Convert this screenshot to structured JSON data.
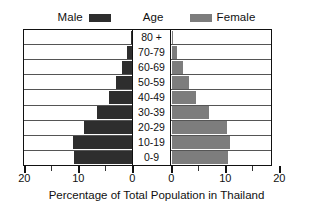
{
  "legend": {
    "male_label": "Male",
    "center_label": "Age",
    "female_label": "Female",
    "male_color": "#2e2e2e",
    "female_color": "#7d7d7d"
  },
  "axis": {
    "title": "Percentage of Total Population in Thailand",
    "left_ticks": [
      "20",
      "10",
      "0"
    ],
    "right_ticks": [
      "0",
      "10",
      "20"
    ]
  },
  "chart_data": {
    "type": "bar",
    "subtype": "population-pyramid",
    "title": "",
    "xlabel": "Percentage of Total Population in Thailand",
    "ylabel": "Age",
    "categories": [
      "80 +",
      "70-79",
      "60-69",
      "50-59",
      "40-49",
      "30-39",
      "20-29",
      "10-19",
      "0-9"
    ],
    "xlim": [
      0,
      20
    ],
    "xticks": [
      0,
      10,
      20
    ],
    "grid": true,
    "legend_position": "top",
    "series": [
      {
        "name": "Male",
        "color": "#2e2e2e",
        "side": "left",
        "values": [
          0.3,
          1.0,
          2.0,
          3.0,
          4.3,
          6.5,
          9.0,
          11.0,
          10.8
        ]
      },
      {
        "name": "Female",
        "color": "#7d7d7d",
        "side": "right",
        "values": [
          0.3,
          1.0,
          2.2,
          3.3,
          4.5,
          7.0,
          10.2,
          10.8,
          10.5
        ]
      }
    ]
  }
}
